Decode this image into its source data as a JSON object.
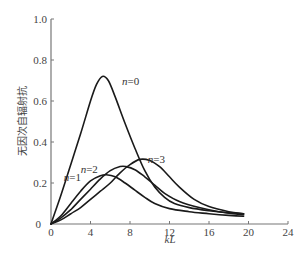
{
  "chart_data": {
    "type": "line",
    "title": "",
    "xlabel": "kL",
    "ylabel": "无因次自辐射抗",
    "xlim": [
      0,
      24
    ],
    "ylim": [
      0,
      1.0
    ],
    "xticks": [
      0,
      4,
      8,
      12,
      16,
      20,
      24
    ],
    "yticks": [
      0,
      0.2,
      0.4,
      0.6,
      0.8,
      1.0
    ],
    "ytick_labels": [
      "0",
      "0.2",
      "0.4",
      "0.6",
      "0.8",
      "1.0"
    ],
    "xtick_labels": [
      "0",
      "4",
      "8",
      "12",
      "16",
      "20",
      "24"
    ],
    "grid": false,
    "legend": "inline labels",
    "series": [
      {
        "name": "n=0",
        "label_n": "n",
        "label_val": "=0",
        "label_pos": [
          7.2,
          0.68
        ],
        "x": [
          0,
          1,
          2,
          3,
          4,
          4.6,
          5.2,
          5.8,
          6.5,
          7.5,
          8.5,
          9.5,
          10.5,
          11.5,
          12.5,
          14,
          16,
          18,
          19.5
        ],
        "y": [
          0,
          0.14,
          0.29,
          0.44,
          0.6,
          0.68,
          0.72,
          0.7,
          0.62,
          0.49,
          0.37,
          0.26,
          0.18,
          0.13,
          0.1,
          0.08,
          0.065,
          0.055,
          0.05
        ]
      },
      {
        "name": "n=1",
        "label_n": "n",
        "label_val": "=1",
        "label_pos": [
          1.3,
          0.21
        ],
        "x": [
          0,
          1,
          2,
          3,
          4,
          5,
          5.6,
          6.5,
          7.5,
          8.5,
          9.5,
          10.5,
          12,
          14,
          16,
          18,
          19.5
        ],
        "y": [
          0,
          0.04,
          0.1,
          0.16,
          0.21,
          0.235,
          0.24,
          0.23,
          0.2,
          0.165,
          0.13,
          0.1,
          0.075,
          0.06,
          0.05,
          0.042,
          0.038
        ]
      },
      {
        "name": "n=2",
        "label_n": "n",
        "label_val": "=2",
        "label_pos": [
          3.0,
          0.25
        ],
        "x": [
          0,
          1,
          2,
          3,
          4,
          5,
          6,
          7,
          7.6,
          8.5,
          9.5,
          10.5,
          11.5,
          13,
          15,
          17,
          19.5
        ],
        "y": [
          0,
          0.03,
          0.07,
          0.12,
          0.17,
          0.22,
          0.26,
          0.28,
          0.28,
          0.265,
          0.23,
          0.19,
          0.15,
          0.11,
          0.08,
          0.06,
          0.045
        ]
      },
      {
        "name": "n=3",
        "label_n": "n",
        "label_val": "=3",
        "label_pos": [
          9.8,
          0.3
        ],
        "x": [
          0,
          1,
          2,
          3,
          4,
          5,
          6,
          7,
          8,
          9,
          10,
          11,
          12,
          13,
          14.5,
          16,
          18,
          19.5
        ],
        "y": [
          0,
          0.02,
          0.05,
          0.08,
          0.12,
          0.16,
          0.2,
          0.25,
          0.29,
          0.315,
          0.31,
          0.28,
          0.23,
          0.18,
          0.12,
          0.085,
          0.06,
          0.05
        ]
      }
    ]
  }
}
